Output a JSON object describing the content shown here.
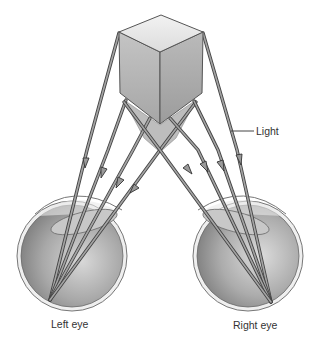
{
  "figure": {
    "type": "binocular-vision-diagram",
    "object": "cube",
    "labels": {
      "light": "Light",
      "left_eye": "Left eye",
      "right_eye": "Right eye"
    },
    "colors": {
      "background": "#ffffff",
      "cube_top": "#ebebeb",
      "cube_left": "#b5b5b5",
      "cube_right": "#a9a9a9",
      "cube_edge": "#555555",
      "shadow": "#bdbdbd",
      "ray_fill": "#a0a0a0",
      "ray_edge": "#444444",
      "eye_inner": "#9c9c9c",
      "eye_rim": "#e6e6e6",
      "label_text": "#333333"
    }
  }
}
